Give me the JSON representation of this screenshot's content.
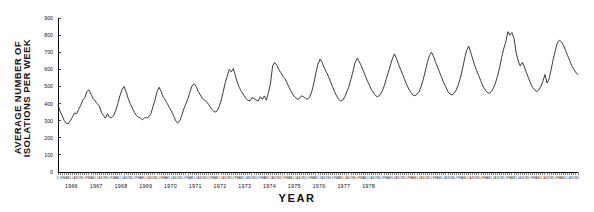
{
  "axis_titles": {
    "y_line1": "AVERAGE NUMBER OF",
    "y_line2": "ISOLATIONS PER WEEK",
    "x": "YEAR"
  },
  "chart_data": {
    "type": "line",
    "title": "",
    "subtitle": "",
    "xlabel": "YEAR",
    "ylabel": "AVERAGE NUMBER OF ISOLATIONS PER WEEK",
    "ylim": [
      0,
      900
    ],
    "ytick_labels": [
      "0",
      "100",
      "200",
      "300",
      "400",
      "500",
      "600",
      "700",
      "800",
      "900"
    ],
    "ytick_values": [
      0,
      100,
      200,
      300,
      400,
      500,
      600,
      700,
      800,
      900
    ],
    "grid": false,
    "legend": "none",
    "x_axis_kind": "monthly-time-series",
    "years": [
      "1966",
      "1967",
      "1968",
      "1969",
      "1970",
      "1971",
      "1972",
      "1973",
      "1974",
      "1975",
      "1976",
      "1977",
      "1978"
    ],
    "month_ticks": [
      "J",
      "F",
      "M",
      "A",
      "M",
      "J",
      "J",
      "A",
      "S",
      "O",
      "N",
      "D"
    ],
    "x_start": "1965-12",
    "x_end": "1978-12",
    "series": [
      {
        "name": "Average isolations per week",
        "color": "#1a1a1a",
        "values": [
          390,
          355,
          330,
          300,
          285,
          282,
          300,
          320,
          345,
          340,
          365,
          390,
          420,
          435,
          470,
          480,
          455,
          430,
          415,
          400,
          385,
          350,
          330,
          315,
          340,
          320,
          318,
          330,
          360,
          400,
          445,
          480,
          500,
          470,
          430,
          400,
          375,
          350,
          330,
          320,
          315,
          305,
          318,
          316,
          322,
          340,
          380,
          420,
          470,
          495,
          470,
          440,
          420,
          400,
          375,
          355,
          330,
          300,
          285,
          300,
          330,
          370,
          400,
          430,
          470,
          505,
          515,
          500,
          470,
          450,
          430,
          420,
          410,
          395,
          375,
          360,
          350,
          355,
          380,
          415,
          465,
          520,
          560,
          600,
          585,
          605,
          560,
          520,
          490,
          470,
          450,
          430,
          420,
          415,
          435,
          430,
          420,
          415,
          440,
          425,
          445,
          420,
          465,
          520,
          620,
          640,
          625,
          600,
          580,
          560,
          545,
          520,
          495,
          470,
          450,
          435,
          425,
          430,
          445,
          440,
          430,
          425,
          440,
          470,
          520,
          580,
          630,
          660,
          640,
          610,
          585,
          560,
          530,
          500,
          470,
          445,
          425,
          415,
          420,
          440,
          470,
          500,
          545,
          590,
          640,
          665,
          645,
          620,
          590,
          560,
          530,
          505,
          480,
          460,
          445,
          440,
          450,
          470,
          500,
          540,
          580,
          620,
          660,
          690,
          665,
          630,
          600,
          570,
          540,
          510,
          485,
          465,
          450,
          445,
          455,
          470,
          500,
          540,
          590,
          640,
          680,
          700,
          675,
          640,
          610,
          580,
          550,
          520,
          495,
          470,
          455,
          450,
          460,
          480,
          510,
          550,
          600,
          660,
          710,
          735,
          700,
          660,
          620,
          590,
          560,
          530,
          500,
          480,
          465,
          460,
          470,
          490,
          520,
          560,
          610,
          670,
          720,
          760,
          820,
          800,
          815,
          780,
          700,
          650,
          620,
          640,
          615,
          580,
          550,
          520,
          495,
          480,
          470,
          480,
          500,
          530,
          570,
          520,
          545,
          600,
          660,
          710,
          755,
          770,
          760,
          740,
          710,
          680,
          650,
          620,
          600,
          580,
          570
        ]
      }
    ]
  }
}
